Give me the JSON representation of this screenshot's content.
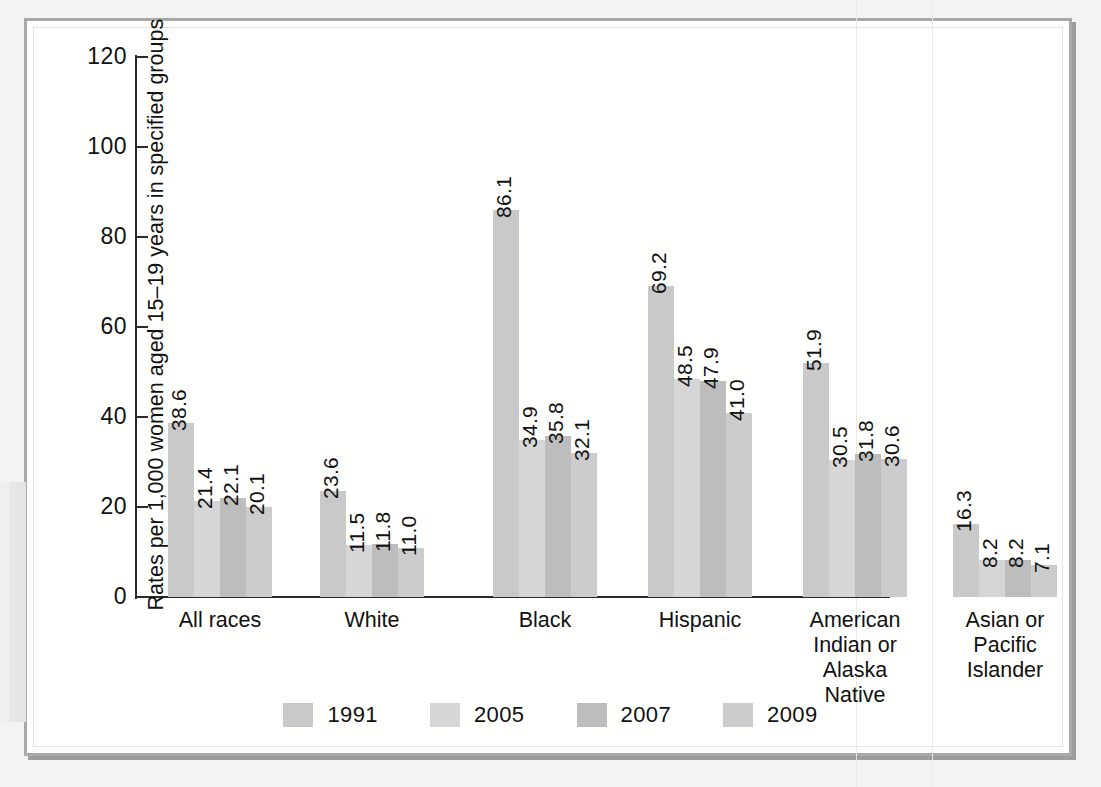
{
  "chart_data": {
    "type": "bar",
    "title": "",
    "subtitle": "",
    "xlabel": "",
    "ylabel": "Rates per 1,000 women aged 15–19 years in specified groups",
    "ylim": [
      0,
      120
    ],
    "yticks": [
      0,
      20,
      40,
      60,
      80,
      100,
      120
    ],
    "ytick_labels": [
      "0",
      "20",
      "40",
      "60",
      "80",
      "100",
      "120"
    ],
    "grid": false,
    "legend_position": "bottom-center",
    "categories": [
      "All races",
      "White",
      "Black",
      "Hispanic",
      "American\nIndian or\nAlaska\nNative",
      "Asian or\nPacific\nIslander"
    ],
    "series": [
      {
        "name": "1991",
        "color": "#c9c9c9",
        "values": [
          38.6,
          23.6,
          86.1,
          69.2,
          51.9,
          16.3
        ],
        "labels": [
          "38.6",
          "23.6",
          "86.1",
          "69.2",
          "51.9",
          "16.3"
        ]
      },
      {
        "name": "2005",
        "color": "#d6d6d6",
        "values": [
          21.4,
          11.5,
          34.9,
          48.5,
          30.5,
          8.2
        ],
        "labels": [
          "21.4",
          "11.5",
          "34.9",
          "48.5",
          "30.5",
          "8.2"
        ]
      },
      {
        "name": "2007",
        "color": "#bdbdbd",
        "values": [
          22.1,
          11.8,
          35.8,
          47.9,
          31.8,
          8.2
        ],
        "labels": [
          "22.1",
          "11.8",
          "35.8",
          "47.9",
          "31.8",
          "8.2"
        ]
      },
      {
        "name": "2009",
        "color": "#cccccc",
        "values": [
          20.1,
          11.0,
          32.1,
          41.0,
          30.6,
          7.1
        ],
        "labels": [
          "20.1",
          "11.0",
          "32.1",
          "41.0",
          "30.6",
          "7.1"
        ]
      }
    ]
  },
  "legend": {
    "items": [
      {
        "label": "1991",
        "color": "#c9c9c9"
      },
      {
        "label": "2005",
        "color": "#d6d6d6"
      },
      {
        "label": "2007",
        "color": "#bdbdbd"
      },
      {
        "label": "2009",
        "color": "#cccccc"
      }
    ]
  },
  "colors": {
    "axis": "#2b2b2b",
    "text": "#111111",
    "page_background": "#fffffe",
    "frame": "#a9a9a9"
  }
}
